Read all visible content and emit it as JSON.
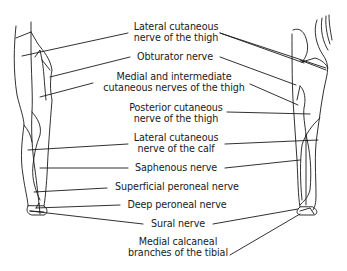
{
  "diagram": {
    "type": "anatomical-dermatome-map",
    "colors": {
      "ink": "#1a1a1a",
      "background": "#ffffff"
    },
    "labels": [
      {
        "id": "lateral-cutaneous-thigh",
        "lines": [
          "Lateral cutaneous",
          "nerve of the thigh"
        ]
      },
      {
        "id": "obturator",
        "lines": [
          "Obturator nerve"
        ]
      },
      {
        "id": "medial-intermediate-cutaneous-thigh",
        "lines": [
          "Medial and intermediate",
          "cutaneous nerves of the thigh"
        ]
      },
      {
        "id": "posterior-cutaneous-thigh",
        "lines": [
          "Posterior cutaneous",
          "nerve of the thigh"
        ]
      },
      {
        "id": "lateral-cutaneous-calf",
        "lines": [
          "Lateral cutaneous",
          "nerve of the calf"
        ]
      },
      {
        "id": "saphenous",
        "lines": [
          "Saphenous nerve"
        ]
      },
      {
        "id": "superficial-peroneal",
        "lines": [
          "Superficial peroneal nerve"
        ]
      },
      {
        "id": "deep-peroneal",
        "lines": [
          "Deep peroneal nerve"
        ]
      },
      {
        "id": "sural",
        "lines": [
          "Sural nerve"
        ]
      },
      {
        "id": "medial-calcaneal",
        "lines": [
          "Medial calcaneal",
          "branches of the tibial"
        ]
      }
    ]
  }
}
